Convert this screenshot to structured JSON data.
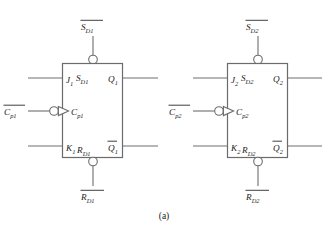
{
  "figure": {
    "caption": "(a)",
    "type": "jk-flip-flop-pair-logic-symbol",
    "colors": {
      "line": "#6b6b6b",
      "text": "#1c1c1c",
      "background": "#ffffff"
    }
  },
  "flipflops": [
    {
      "id": "ff1",
      "external_set_label": "S",
      "external_set_sub": "D1",
      "external_set_overbar": true,
      "internal_set_label": "S",
      "internal_set_sub": "D1",
      "external_reset_label": "R",
      "external_reset_sub": "D1",
      "external_reset_overbar": true,
      "internal_reset_label": "R",
      "internal_reset_sub": "D1",
      "j_label": "J",
      "j_sub": "1",
      "k_label": "K",
      "k_sub": "1",
      "external_clock_label": "C",
      "external_clock_sub": "p1",
      "external_clock_overbar": true,
      "internal_clock_label": "C",
      "internal_clock_sub": "p1",
      "q_label": "Q",
      "q_sub": "1",
      "qbar_label": "Q",
      "qbar_sub": "1",
      "qbar_overbar": true
    },
    {
      "id": "ff2",
      "external_set_label": "S",
      "external_set_sub": "D2",
      "external_set_overbar": true,
      "internal_set_label": "S",
      "internal_set_sub": "D2",
      "external_reset_label": "R",
      "external_reset_sub": "D2",
      "external_reset_overbar": true,
      "internal_reset_label": "R",
      "internal_reset_sub": "D2",
      "j_label": "J",
      "j_sub": "2",
      "k_label": "K",
      "k_sub": "2",
      "external_clock_label": "C",
      "external_clock_sub": "p2",
      "external_clock_overbar": true,
      "internal_clock_label": "C",
      "internal_clock_sub": "p2",
      "q_label": "Q",
      "q_sub": "2",
      "qbar_label": "Q",
      "qbar_sub": "2",
      "qbar_overbar": true
    }
  ]
}
